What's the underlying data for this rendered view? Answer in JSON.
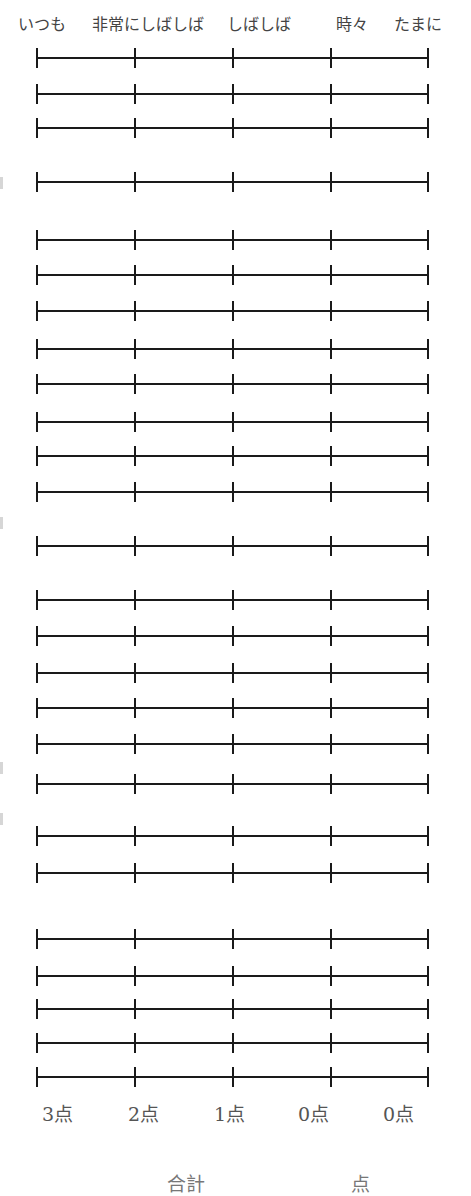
{
  "header": {
    "labels": [
      {
        "text": "いつも",
        "x": 18
      },
      {
        "text": "非常にしばしば",
        "x": 92
      },
      {
        "text": "しばしば",
        "x": 227
      },
      {
        "text": "時々",
        "x": 336
      },
      {
        "text": "たまに",
        "x": 394
      }
    ]
  },
  "scale": {
    "tick_x": [
      36,
      134,
      232,
      330,
      427
    ],
    "rows": [
      {
        "y": 47
      },
      {
        "y": 83
      },
      {
        "y": 117
      },
      {
        "y": 171
      },
      {
        "y": 229
      },
      {
        "y": 264
      },
      {
        "y": 300
      },
      {
        "y": 338
      },
      {
        "y": 373
      },
      {
        "y": 411
      },
      {
        "y": 445
      },
      {
        "y": 481
      },
      {
        "y": 535
      },
      {
        "y": 589
      },
      {
        "y": 625
      },
      {
        "y": 662
      },
      {
        "y": 697
      },
      {
        "y": 733
      },
      {
        "y": 773
      },
      {
        "y": 825
      },
      {
        "y": 862
      },
      {
        "y": 928
      },
      {
        "y": 965
      },
      {
        "y": 998
      },
      {
        "y": 1032
      },
      {
        "y": 1066
      }
    ]
  },
  "scores": [
    {
      "text": "3点",
      "x": 42
    },
    {
      "text": "2点",
      "x": 128
    },
    {
      "text": "1点",
      "x": 214
    },
    {
      "text": "0点",
      "x": 298
    },
    {
      "text": "0点",
      "x": 383
    }
  ],
  "total": {
    "label": "合計",
    "unit": "点"
  },
  "edge_marks": [
    177,
    517,
    762,
    813
  ]
}
